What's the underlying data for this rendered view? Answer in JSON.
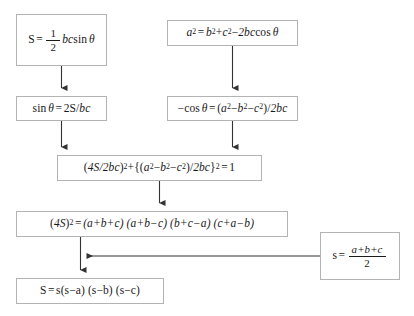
{
  "diagram": {
    "type": "flowchart",
    "orientation": "top-to-bottom",
    "background_color": "#ffffff",
    "box_border_color": "#b3b3b3",
    "connector_color": "#333333",
    "text_color": "#1a1a1a",
    "nodes": [
      {
        "id": "area-sine",
        "label": "S = (1/2) bc sin θ",
        "parts": {
          "lhs": "S",
          "eq": "=",
          "num": "1",
          "den": "2",
          "rhs": "bc",
          "func": "sin",
          "arg": "θ"
        }
      },
      {
        "id": "law-cosines",
        "label": "a² = b²+c²−2bc cos θ",
        "parts": {
          "lhs": "a",
          "lhs_sup": "2",
          "eq": "=",
          "t1": "b",
          "t1_sup": "2",
          "plus": "+",
          "t2": "c",
          "t2_sup": "2",
          "minus": "−",
          "t3": "2bc",
          "func": "cos",
          "arg": "θ"
        }
      },
      {
        "id": "sin-theta",
        "label": "sin θ = 2S/bc",
        "parts": {
          "func": "sin",
          "arg": "θ",
          "eq": "=",
          "rhs_num": "2S",
          "slash": "/",
          "rhs_den": "bc"
        }
      },
      {
        "id": "neg-cos-theta",
        "label": "−cos θ = (a²−b²−c²)/2bc",
        "parts": {
          "neg": "−",
          "func": "cos",
          "arg": "θ",
          "eq": "=",
          "open": "(",
          "a": "a",
          "a_sup": "2",
          "m1": "−",
          "b": "b",
          "b_sup": "2",
          "m2": "−",
          "c": "c",
          "c_sup": "2",
          "close": ")",
          "slash": "/",
          "den": "2bc"
        }
      },
      {
        "id": "pythag-ident",
        "label": "(4S/2bc)²+{(a²−b²−c²)/2bc}² = 1",
        "parts": {
          "p1_open": "(",
          "p1": "4S/2bc",
          "p1_close": ")",
          "p1_sup": "2",
          "plus": "+",
          "brace_open": "{",
          "p2_open": "(",
          "a": "a",
          "a_sup": "2",
          "m1": "−",
          "b": "b",
          "b_sup": "2",
          "m2": "−",
          "c": "c",
          "c_sup": "2",
          "p2_close": ")",
          "slash": "/",
          "den": "2bc",
          "brace_close": "}",
          "p2_sup": "2",
          "eq": "=",
          "one": "1"
        }
      },
      {
        "id": "expanded-16s2",
        "label": "(4S)² = (a+b+c)(a+b−c)(b+c−a)(c+a−b)",
        "parts": {
          "lhs_open": "(",
          "lhs": "4S",
          "lhs_close": ")",
          "lhs_sup": "2",
          "eq": "=",
          "f1": "(a+b+c)",
          "f2": "(a+b−c)",
          "f3": "(b+c−a)",
          "f4": "(c+a−b)"
        }
      },
      {
        "id": "semiperimeter",
        "label": "s = (a+b+c)/2",
        "parts": {
          "lhs": "s",
          "eq": "=",
          "num": "a+b+c",
          "den": "2"
        }
      },
      {
        "id": "heron-formula",
        "label": "S = s(s−a)(s−b)(s−c)",
        "parts": {
          "lhs": "S",
          "eq": "=",
          "s": "s",
          "f1": "(s−a)",
          "f2": "(s−b)",
          "f3": "(s−c)"
        }
      }
    ],
    "edges": [
      {
        "id": "edge-area-to-sin",
        "from": "area-sine",
        "to": "sin-theta",
        "direction": "down"
      },
      {
        "id": "edge-cos-to-negcos",
        "from": "law-cosines",
        "to": "neg-cos-theta",
        "direction": "down"
      },
      {
        "id": "edge-sin-to-ident",
        "from": "sin-theta",
        "to": "pythag-ident",
        "direction": "down"
      },
      {
        "id": "edge-negcos-to-ident",
        "from": "neg-cos-theta",
        "to": "pythag-ident",
        "direction": "down"
      },
      {
        "id": "edge-ident-to-expanded",
        "from": "pythag-ident",
        "to": "expanded-16s2",
        "direction": "down"
      },
      {
        "id": "edge-expanded-to-heron",
        "from": "expanded-16s2",
        "to": "heron-formula",
        "direction": "down"
      },
      {
        "id": "edge-semiperim-to-heron",
        "from": "semiperimeter",
        "to": "heron-formula",
        "direction": "left"
      }
    ]
  }
}
